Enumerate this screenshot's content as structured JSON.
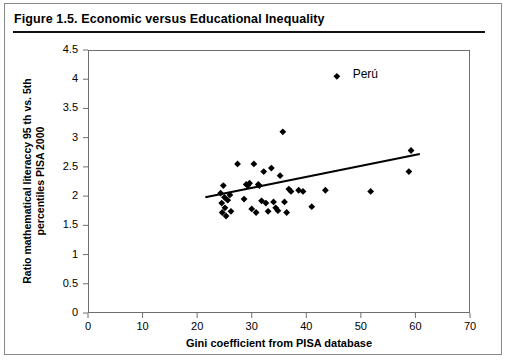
{
  "figure": {
    "title": "Figure 1.5.  Economic versus Educational Inequality"
  },
  "chart_data": {
    "type": "scatter",
    "title": "Figure 1.5.  Economic versus Educational Inequality",
    "xlabel": "Gini coefficient from PISA database",
    "ylabel": "Ratio mathematical literaccy 95 th vs. 5th percentiles PISA 2000",
    "xlim": [
      0,
      70
    ],
    "ylim": [
      0,
      4.5
    ],
    "xticks": [
      "0",
      "10",
      "20",
      "30",
      "40",
      "50",
      "60",
      "70"
    ],
    "xtick_values": [
      0,
      10,
      20,
      30,
      40,
      50,
      60,
      70
    ],
    "yticks": [
      "0",
      "0.5",
      "1",
      "1.5",
      "2",
      "2.5",
      "3",
      "3.5",
      "4",
      "4.5"
    ],
    "ytick_values": [
      0,
      0.5,
      1,
      1.5,
      2,
      2.5,
      3,
      3.5,
      4,
      4.5
    ],
    "grid": false,
    "legend": null,
    "marker": "diamond",
    "marker_color": "#000000",
    "points": [
      [
        24.3,
        2.05
      ],
      [
        24.5,
        1.88
      ],
      [
        24.6,
        1.72
      ],
      [
        24.8,
        2.18
      ],
      [
        25.0,
        1.98
      ],
      [
        25.1,
        1.8
      ],
      [
        25.3,
        1.66
      ],
      [
        25.6,
        1.93
      ],
      [
        26.0,
        2.02
      ],
      [
        26.2,
        1.74
      ],
      [
        27.4,
        2.55
      ],
      [
        28.6,
        1.95
      ],
      [
        29.0,
        2.2
      ],
      [
        29.3,
        2.18
      ],
      [
        29.6,
        2.22
      ],
      [
        30.0,
        1.78
      ],
      [
        30.4,
        2.55
      ],
      [
        30.8,
        1.72
      ],
      [
        31.2,
        2.2
      ],
      [
        31.4,
        2.18
      ],
      [
        31.8,
        1.92
      ],
      [
        32.2,
        2.42
      ],
      [
        32.6,
        1.88
      ],
      [
        33.0,
        1.74
      ],
      [
        33.6,
        2.48
      ],
      [
        34.0,
        1.9
      ],
      [
        34.4,
        1.8
      ],
      [
        34.8,
        1.75
      ],
      [
        35.2,
        2.35
      ],
      [
        35.7,
        3.1
      ],
      [
        36.0,
        1.9
      ],
      [
        36.4,
        1.72
      ],
      [
        36.8,
        2.12
      ],
      [
        37.2,
        2.08
      ],
      [
        38.6,
        2.1
      ],
      [
        39.4,
        2.08
      ],
      [
        41.0,
        1.82
      ],
      [
        43.5,
        2.1
      ],
      [
        45.6,
        4.05
      ],
      [
        51.8,
        2.08
      ],
      [
        58.8,
        2.42
      ],
      [
        59.2,
        2.78
      ]
    ],
    "trendline": {
      "x": [
        21.5,
        60.8
      ],
      "y": [
        1.98,
        2.72
      ],
      "color": "#000000",
      "width": 2
    },
    "annotations": [
      {
        "label": "Perú",
        "x": 45.6,
        "y": 4.05,
        "label_x": 48.5,
        "label_y": 4.08
      }
    ]
  }
}
